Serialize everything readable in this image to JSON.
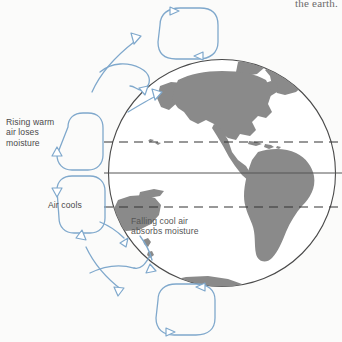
{
  "figure": {
    "title_fragment": "the earth.",
    "background_color": "#fbfbfa"
  },
  "globe": {
    "name": "earth-globe",
    "center_x": 222,
    "center_y": 173,
    "radius": 114,
    "outline_color": "#4a4a4a",
    "land_color": "#8a8a8a",
    "ocean_color": "#ffffff",
    "landmasses": [
      "North America",
      "Greenland",
      "Alaska",
      "Central America",
      "Caribbean Islands",
      "South America",
      "Australia",
      "New Guinea",
      "New Zealand",
      "Antarctica"
    ]
  },
  "latitude_lines": [
    {
      "name": "Tropic of Cancer",
      "style": "dashed",
      "y": 142,
      "color": "#333333"
    },
    {
      "name": "Equator",
      "style": "solid",
      "y": 173,
      "color": "#555555"
    },
    {
      "name": "Tropic of Capricorn",
      "style": "dashed",
      "y": 207,
      "color": "#333333"
    }
  ],
  "labels": {
    "rising": "Rising warm\nair loses\nmoisture",
    "cools": "Air cools",
    "falling": "Falling cool air\nabsorbs moisture"
  },
  "circulation": {
    "arrow_color": "#7fa8cc",
    "cells": [
      {
        "name": "polar-cell-north",
        "position": "top"
      },
      {
        "name": "hadley-cell-upper-left",
        "position": "upper-left"
      },
      {
        "name": "hadley-cell-lower-left",
        "position": "lower-left"
      },
      {
        "name": "polar-cell-south",
        "position": "bottom"
      }
    ]
  }
}
